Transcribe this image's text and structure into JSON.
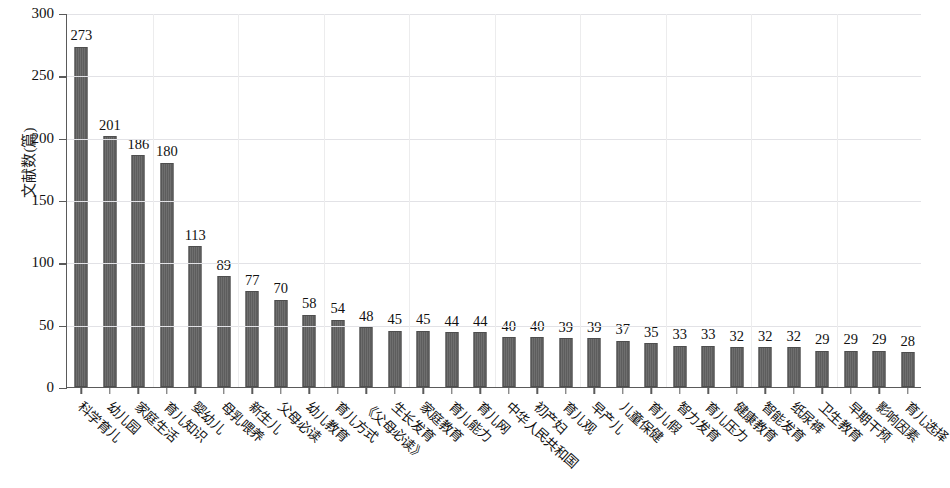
{
  "chart_data": {
    "type": "bar",
    "title": "",
    "subtitle": "",
    "xlabel": "",
    "ylabel": "文献数(篇)",
    "ylim": [
      0,
      300
    ],
    "yticks": [
      0,
      50,
      100,
      150,
      200,
      250,
      300
    ],
    "grid": true,
    "legend": null,
    "bar_color": "#646464",
    "axis_color": "#5a5a5a",
    "grid_color": "#e2e2e6",
    "categories": [
      "科学育儿",
      "幼儿园",
      "家庭生活",
      "育儿知识",
      "婴幼儿",
      "母乳喂养",
      "新生儿",
      "父母必读",
      "幼儿教育",
      "育儿方式",
      "《父母必读》",
      "生长发育",
      "家庭教育",
      "育儿能力",
      "育儿网",
      "中华人民共和国",
      "初产妇",
      "育儿观",
      "早产儿",
      "儿童保健",
      "育儿假",
      "智力发育",
      "育儿压力",
      "健康教育",
      "智能发育",
      "纸尿裤",
      "卫生教育",
      "早期干预",
      "影响因素",
      "育儿选择"
    ],
    "values": [
      273,
      201,
      186,
      180,
      113,
      89,
      77,
      70,
      58,
      54,
      48,
      45,
      45,
      44,
      44,
      40,
      40,
      39,
      39,
      37,
      35,
      33,
      33,
      32,
      32,
      32,
      29,
      29,
      29,
      28
    ],
    "value_labels": [
      "273",
      "201",
      "186",
      "180",
      "113",
      "89",
      "77",
      "70",
      "58",
      "54",
      "48",
      "45",
      "45",
      "44",
      "44",
      "40",
      "40",
      "39",
      "39",
      "37",
      "35",
      "33",
      "33",
      "32",
      "32",
      "32",
      "29",
      "29",
      "29",
      "28"
    ],
    "ytick_labels": [
      "0",
      "50",
      "100",
      "150",
      "200",
      "250",
      "300"
    ]
  }
}
